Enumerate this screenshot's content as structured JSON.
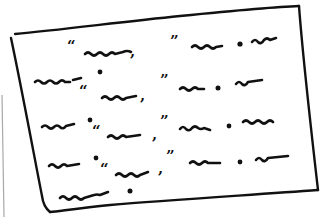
{
  "illustration": {
    "subject": "hand-drawn page of placeholder dialogue text",
    "colors": {
      "ink": "#111111",
      "paper": "#ffffff",
      "shadow_edge": "#a8a8a8"
    },
    "page_corners": {
      "top_left": [
        14,
        33
      ],
      "top_right": [
        299,
        6
      ],
      "bottom_right": [
        318,
        192
      ],
      "bottom_left": [
        48,
        213
      ]
    },
    "lines": [
      {
        "tokens": [
          "“",
          "squiggle",
          ",",
          "”",
          "squiggle",
          ".",
          "squiggle"
        ]
      },
      {
        "tokens": [
          "squiggle",
          "."
        ]
      },
      {
        "tokens": [
          "“",
          "squiggle",
          ",",
          "”",
          "squiggle",
          ".",
          "squiggle"
        ]
      },
      {
        "tokens": [
          "squiggle",
          ".",
          "“",
          "squiggle",
          ",",
          "”",
          "squiggle",
          ".",
          "squiggle"
        ]
      },
      {
        "tokens": [
          "squiggle",
          ".",
          "“",
          "squiggle",
          ",",
          "”",
          "squiggle",
          ".",
          "squiggle"
        ]
      },
      {
        "tokens": [
          "squiggle",
          "."
        ]
      }
    ],
    "glyphs": {
      "open_quote": "“",
      "close_quote": "”",
      "comma": ",",
      "period": "."
    }
  }
}
